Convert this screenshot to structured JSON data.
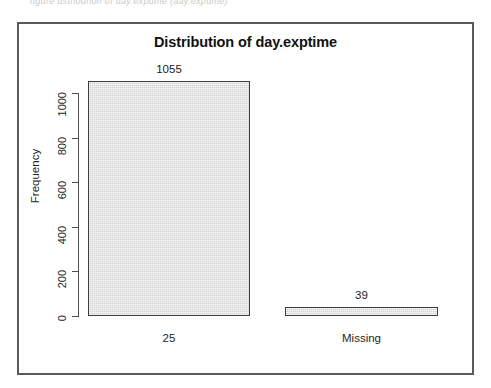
{
  "page": {
    "top_cut_text": "ngure           ustnounon of uay.expume (aay.expume)",
    "frame_color": "#5a5a5a",
    "background": "#ffffff"
  },
  "chart_data": {
    "type": "bar",
    "title": "Distribution of day.exptime",
    "xlabel": "",
    "ylabel": "Frequency",
    "categories": [
      "25",
      "Missing"
    ],
    "values": [
      1055,
      39
    ],
    "value_labels": [
      "1055",
      "39"
    ],
    "ylim": [
      0,
      1055
    ],
    "yticks": [
      0,
      200,
      400,
      600,
      800,
      1000
    ],
    "ytick_labels": [
      "0",
      "200",
      "400",
      "600",
      "800",
      "1000"
    ],
    "grid": false,
    "legend": "none",
    "bar_fill_color": "#d3d3d3",
    "bar_border_color": "#3d3d3d",
    "axis_color": "#4d4d4d"
  }
}
